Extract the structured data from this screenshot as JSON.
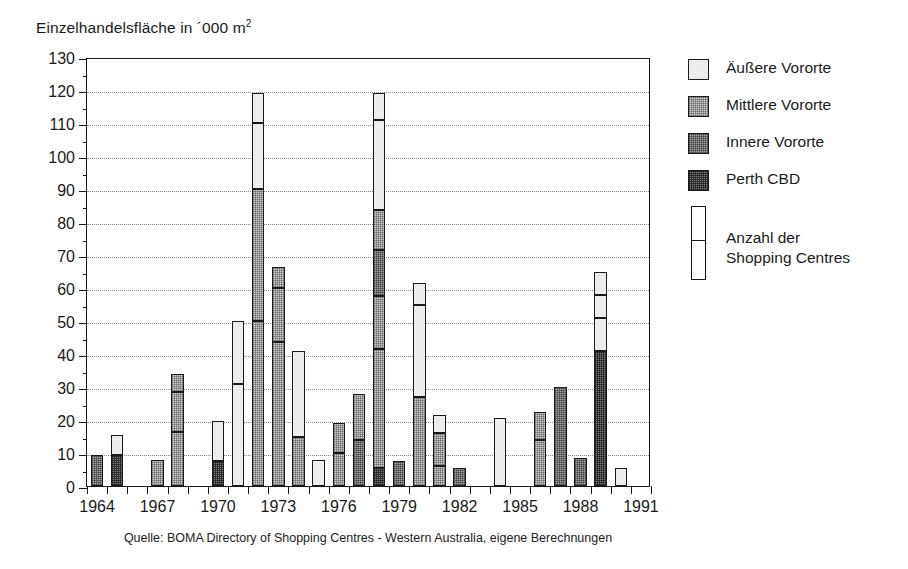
{
  "chart_data": {
    "type": "bar",
    "title": "",
    "ylabel": "Einzelhandelsfläche in ´000 m²",
    "ylabel_plain": "Einzelhandelsflaeche in '000 m2",
    "xlabel": "",
    "ylim": [
      0,
      130
    ],
    "ytick_step": 10,
    "yminor_step": 5,
    "ytick_labels": [
      "0",
      "10",
      "20",
      "30",
      "40",
      "50",
      "60",
      "70",
      "80",
      "90",
      "100",
      "110",
      "120",
      "130"
    ],
    "xlim": [
      1963.5,
      1991.5
    ],
    "xtick_labels": [
      "1964",
      "1967",
      "1970",
      "1973",
      "1976",
      "1979",
      "1982",
      "1985",
      "1988",
      "1991"
    ],
    "xtick_values": [
      1964,
      1967,
      1970,
      1973,
      1976,
      1979,
      1982,
      1985,
      1988,
      1991
    ],
    "grid": "horizontal-dotted",
    "legend_position": "right",
    "stacked": true,
    "note": "Each bar is a stacked column; internal horizontal dividers mark individual shopping centres (Anzahl der Shopping Centres).",
    "series": [
      {
        "name": "Äußere Vororte",
        "key": "outer",
        "fill": "#ececeb"
      },
      {
        "name": "Mittlere Vororte",
        "key": "middle",
        "fill": "#d3d3d2"
      },
      {
        "name": "Innere Vororte",
        "key": "inner",
        "fill": "#a9a9a8"
      },
      {
        "name": "Perth CBD",
        "key": "cbd",
        "fill": "#7d7d7c"
      }
    ],
    "bars": [
      {
        "year": 1964,
        "total": 9.5,
        "segments": [
          {
            "from": 0,
            "to": 9.5,
            "series": "inner"
          }
        ]
      },
      {
        "year": 1965,
        "total": 15.5,
        "segments": [
          {
            "from": 0,
            "to": 9.5,
            "series": "cbd"
          },
          {
            "from": 9.5,
            "to": 15.5,
            "series": "outer"
          }
        ]
      },
      {
        "year": 1966,
        "total": 0,
        "segments": []
      },
      {
        "year": 1967,
        "total": 8.0,
        "segments": [
          {
            "from": 0,
            "to": 8.0,
            "series": "middle"
          }
        ]
      },
      {
        "year": 1968,
        "total": 34.0,
        "segments": [
          {
            "from": 0,
            "to": 16.5,
            "series": "middle"
          },
          {
            "from": 16.5,
            "to": 28.5,
            "series": "middle"
          },
          {
            "from": 28.5,
            "to": 34.0,
            "series": "middle"
          }
        ]
      },
      {
        "year": 1969,
        "total": 0,
        "segments": []
      },
      {
        "year": 1970,
        "total": 19.8,
        "segments": [
          {
            "from": 0,
            "to": 7.5,
            "series": "cbd"
          },
          {
            "from": 7.5,
            "to": 19.8,
            "series": "outer"
          }
        ]
      },
      {
        "year": 1971,
        "total": 50.0,
        "segments": [
          {
            "from": 0,
            "to": 31.0,
            "series": "outer"
          },
          {
            "from": 31.0,
            "to": 50.0,
            "series": "outer"
          }
        ]
      },
      {
        "year": 1972,
        "total": 119.0,
        "segments": [
          {
            "from": 0,
            "to": 50.0,
            "series": "middle"
          },
          {
            "from": 50.0,
            "to": 90.0,
            "series": "middle"
          },
          {
            "from": 90.0,
            "to": 110.0,
            "series": "outer"
          },
          {
            "from": 110.0,
            "to": 119.0,
            "series": "outer"
          }
        ]
      },
      {
        "year": 1973,
        "total": 66.5,
        "segments": [
          {
            "from": 0,
            "to": 43.5,
            "series": "middle"
          },
          {
            "from": 43.5,
            "to": 60.0,
            "series": "middle"
          },
          {
            "from": 60.0,
            "to": 66.5,
            "series": "middle"
          }
        ]
      },
      {
        "year": 1974,
        "total": 41.0,
        "segments": [
          {
            "from": 0,
            "to": 15.0,
            "series": "middle"
          },
          {
            "from": 15.0,
            "to": 41.0,
            "series": "outer"
          }
        ]
      },
      {
        "year": 1975,
        "total": 7.8,
        "segments": [
          {
            "from": 0,
            "to": 7.8,
            "series": "outer"
          }
        ]
      },
      {
        "year": 1976,
        "total": 19.0,
        "segments": [
          {
            "from": 0,
            "to": 10.0,
            "series": "middle"
          },
          {
            "from": 10.0,
            "to": 19.0,
            "series": "middle"
          }
        ]
      },
      {
        "year": 1977,
        "total": 28.0,
        "segments": [
          {
            "from": 0,
            "to": 14.0,
            "series": "inner"
          },
          {
            "from": 14.0,
            "to": 28.0,
            "series": "middle"
          }
        ]
      },
      {
        "year": 1978,
        "total": 119.0,
        "segments": [
          {
            "from": 0,
            "to": 5.5,
            "series": "cbd"
          },
          {
            "from": 5.5,
            "to": 41.5,
            "series": "middle"
          },
          {
            "from": 41.5,
            "to": 57.5,
            "series": "middle"
          },
          {
            "from": 57.5,
            "to": 71.5,
            "series": "inner"
          },
          {
            "from": 71.5,
            "to": 83.5,
            "series": "middle"
          },
          {
            "from": 83.5,
            "to": 111.0,
            "series": "outer"
          },
          {
            "from": 111.0,
            "to": 119.0,
            "series": "outer"
          }
        ]
      },
      {
        "year": 1979,
        "total": 7.5,
        "segments": [
          {
            "from": 0,
            "to": 7.5,
            "series": "inner"
          }
        ]
      },
      {
        "year": 1980,
        "total": 61.5,
        "segments": [
          {
            "from": 0,
            "to": 27.0,
            "series": "middle"
          },
          {
            "from": 27.0,
            "to": 55.0,
            "series": "outer"
          },
          {
            "from": 55.0,
            "to": 61.5,
            "series": "outer"
          }
        ]
      },
      {
        "year": 1981,
        "total": 21.5,
        "segments": [
          {
            "from": 0,
            "to": 6.0,
            "series": "middle"
          },
          {
            "from": 6.0,
            "to": 16.0,
            "series": "middle"
          },
          {
            "from": 16.0,
            "to": 21.5,
            "series": "outer"
          }
        ]
      },
      {
        "year": 1982,
        "total": 5.5,
        "segments": [
          {
            "from": 0,
            "to": 5.5,
            "series": "inner"
          }
        ]
      },
      {
        "year": 1983,
        "total": 0,
        "segments": []
      },
      {
        "year": 1984,
        "total": 20.5,
        "segments": [
          {
            "from": 0,
            "to": 20.5,
            "series": "outer"
          }
        ]
      },
      {
        "year": 1985,
        "total": 0,
        "segments": []
      },
      {
        "year": 1986,
        "total": 22.5,
        "segments": [
          {
            "from": 0,
            "to": 14.0,
            "series": "middle"
          },
          {
            "from": 14.0,
            "to": 22.5,
            "series": "middle"
          }
        ]
      },
      {
        "year": 1987,
        "total": 30.0,
        "segments": [
          {
            "from": 0,
            "to": 30.0,
            "series": "inner"
          }
        ]
      },
      {
        "year": 1988,
        "total": 8.5,
        "segments": [
          {
            "from": 0,
            "to": 8.5,
            "series": "inner"
          }
        ]
      },
      {
        "year": 1989,
        "total": 65.0,
        "segments": [
          {
            "from": 0,
            "to": 41.0,
            "series": "cbd"
          },
          {
            "from": 41.0,
            "to": 51.0,
            "series": "outer"
          },
          {
            "from": 51.0,
            "to": 58.0,
            "series": "outer"
          },
          {
            "from": 58.0,
            "to": 65.0,
            "series": "outer"
          }
        ]
      },
      {
        "year": 1990,
        "total": 5.5,
        "segments": [
          {
            "from": 0,
            "to": 5.5,
            "series": "outer"
          }
        ]
      },
      {
        "year": 1991,
        "total": 0,
        "segments": []
      }
    ]
  },
  "axis": {
    "y_title_main": "Einzelhandelsfläche in ´000 m",
    "y_title_sup": "2"
  },
  "legend": {
    "items": [
      {
        "label": "Äußere Vororte",
        "fill": "outer"
      },
      {
        "label": "Mittlere Vororte",
        "fill": "middle"
      },
      {
        "label": "Innere Vororte",
        "fill": "inner"
      },
      {
        "label": "Perth CBD",
        "fill": "cbd"
      }
    ],
    "count_label": "Anzahl der\nShopping Centres"
  },
  "source": {
    "text": "Quelle: BOMA Directory of  Shopping Centres - Western Australia, eigene Berechnungen"
  },
  "colors": {
    "outer": "#ececeb",
    "middle": "#d3d3d2",
    "inner": "#a9a9a8",
    "cbd": "#7d7d7c",
    "ink": "#1a1a1a",
    "grid": "#8a8a8a"
  }
}
